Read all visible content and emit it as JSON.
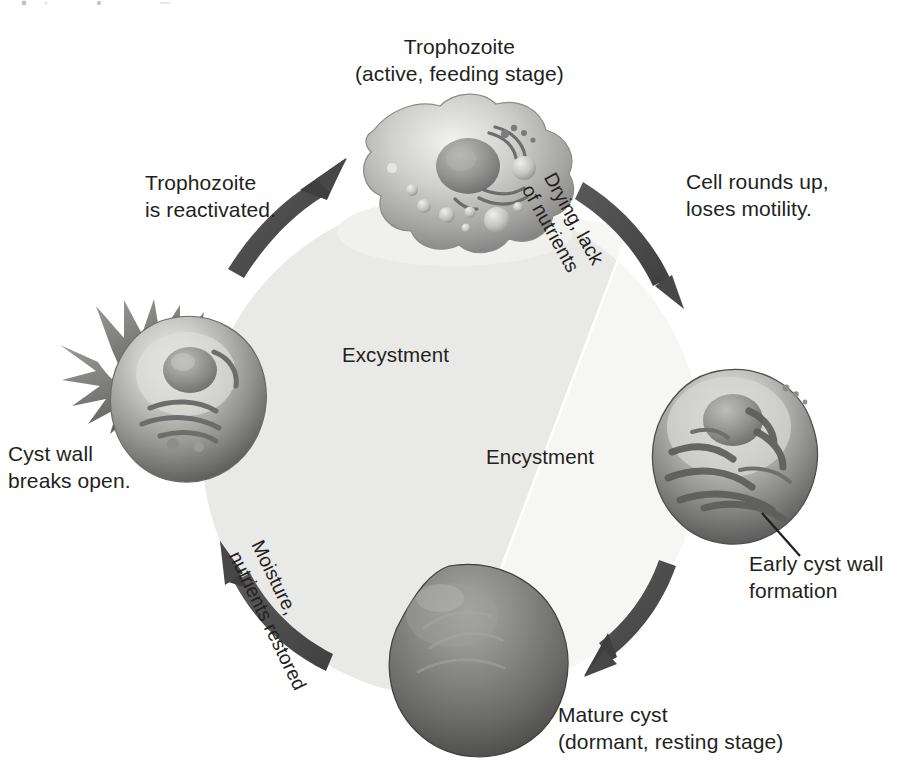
{
  "diagram": {
    "center": {
      "left_half_label": "Excystment",
      "right_half_label": "Encystment",
      "left_half_color": "#e8e8e6",
      "right_half_color": "#f4f4f2"
    },
    "stages": [
      {
        "id": "trophozoite",
        "label": "Trophozoite\n(active, feeding stage)",
        "position": "top",
        "description": "amoeboid cell with pseudopods, nucleus and vacuoles"
      },
      {
        "id": "early-cyst",
        "label": "Early cyst wall\nformation",
        "position": "right",
        "description": "rounded cell with forming cyst wall"
      },
      {
        "id": "mature-cyst",
        "label": "Mature cyst\n(dormant, resting stage)",
        "position": "bottom",
        "description": "dark opaque sphere"
      },
      {
        "id": "rupturing-cyst",
        "label": "Cyst wall\nbreaks open.",
        "position": "left",
        "description": "cyst with ruptured spiky wall releasing cell"
      }
    ],
    "arrows": [
      {
        "id": "encystment-arrow",
        "from": "trophozoite",
        "to": "early-cyst",
        "caption_curved": "Drying, lack\nof nutrients",
        "caption_straight": "Cell rounds up,\nloses motility.",
        "direction": "clockwise"
      },
      {
        "id": "maturation-arrow",
        "from": "early-cyst",
        "to": "mature-cyst",
        "direction": "clockwise"
      },
      {
        "id": "excystment-arrow",
        "from": "mature-cyst",
        "to": "rupturing-cyst",
        "caption_curved": "Moisture,\nnutrients restored",
        "direction": "counter-clockwise-visual"
      },
      {
        "id": "reactivation-arrow",
        "from": "rupturing-cyst",
        "to": "trophozoite",
        "caption_straight": "Trophozoite\nis reactivated.",
        "direction": "clockwise"
      }
    ],
    "colors": {
      "text": "#231f20",
      "arrow": "#4c4c4c",
      "background": "#ffffff",
      "cell_light": "#d8d8d6",
      "cell_mid": "#9a9a98",
      "cell_dark": "#5a5a58"
    }
  }
}
